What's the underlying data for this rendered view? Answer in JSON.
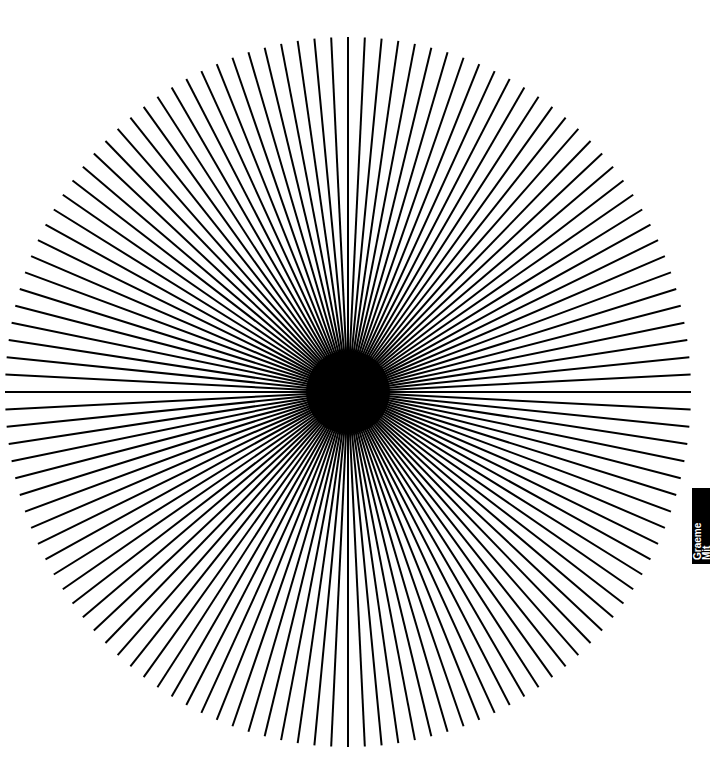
{
  "figure": {
    "type": "radial-line-starburst",
    "center": [
      348,
      392
    ],
    "radius_x": 343,
    "radius_y": 355,
    "line_count": 128,
    "line_width": 2,
    "center_disc_radius": 42,
    "line_color": "#000000",
    "background": "#ffffff"
  },
  "side_tab": {
    "line1": "Graeme",
    "line2": "Mit"
  }
}
